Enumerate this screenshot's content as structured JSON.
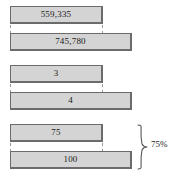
{
  "diagram": {
    "type": "paired-bar-comparison",
    "groups": [
      {
        "name": "group-1",
        "top_bar": {
          "label": "559,335",
          "value": 559335
        },
        "bottom_bar": {
          "label": "745,780",
          "value": 745780
        },
        "annotation": null
      },
      {
        "name": "group-2",
        "top_bar": {
          "label": "3",
          "value": 3
        },
        "bottom_bar": {
          "label": "4",
          "value": 4
        },
        "annotation": null
      },
      {
        "name": "group-3",
        "top_bar": {
          "label": "75",
          "value": 75
        },
        "bottom_bar": {
          "label": "100",
          "value": 100
        },
        "annotation": {
          "label": "75%"
        }
      }
    ],
    "colors": {
      "bar_fill": "#d4d4d4",
      "bar_stroke": "#6b6b6b",
      "connector": "#9a9a9a",
      "text": "#1a1a1a",
      "background": "#ffffff"
    }
  }
}
